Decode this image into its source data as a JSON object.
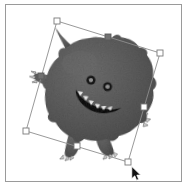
{
  "app": {
    "window_title": "",
    "canvas_background": "#ffffff",
    "frame_border_color": "#9a9a9a"
  },
  "canvas": {
    "name": "drawing-canvas",
    "x": 5,
    "y": 4,
    "width": 177,
    "height": 178
  },
  "artwork": {
    "label": "monster-character",
    "description": "Cartoon spiky round monster with horns, fangs and claws",
    "body_color": "#5e5e5e",
    "body_shadow_color": "#4a4a4a",
    "body_highlight_color": "#767676",
    "outline_color": "#3a3a3a",
    "tooth_color": "#f2f2f2",
    "eye_color": "#1a1a1a",
    "eye_highlight_color": "#8a8a8a"
  },
  "selection": {
    "name": "transform-bounding-box",
    "state": "selected",
    "rotation_degrees": -17,
    "stroke_color": "#8d8d8d",
    "handle_fill": "#ffffff",
    "handle_stroke": "#7a7a7a",
    "active_handle_fill": "#707070",
    "corners": [
      {
        "label": "handle-top-left",
        "x": 57,
        "y": 21
      },
      {
        "label": "handle-top-right",
        "x": 160,
        "y": 53
      },
      {
        "label": "handle-bottom-right",
        "x": 128,
        "y": 162
      },
      {
        "label": "handle-bottom-left",
        "x": 26,
        "y": 131
      }
    ],
    "edges": [
      {
        "label": "handle-top-center",
        "x": 108,
        "y": 37,
        "active": true
      },
      {
        "label": "handle-right-center",
        "x": 144,
        "y": 107,
        "active": false
      },
      {
        "label": "handle-bottom-center",
        "x": 77,
        "y": 146,
        "active": false
      },
      {
        "label": "handle-left-center",
        "x": 41,
        "y": 76,
        "active": true
      }
    ]
  },
  "cursor": {
    "name": "arrow-pointer",
    "type": "default-arrow",
    "x": 131,
    "y": 166,
    "color": "#111111"
  }
}
